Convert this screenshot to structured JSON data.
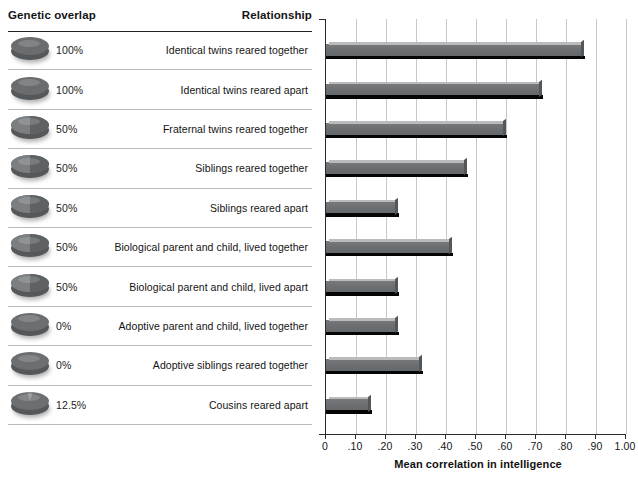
{
  "table": {
    "header_genetic": "Genetic overlap",
    "header_relationship": "Relationship"
  },
  "rows": [
    {
      "percent": "100%",
      "relationship": "Identical twins reared together",
      "disc": "full-100",
      "value": 0.86
    },
    {
      "percent": "100%",
      "relationship": "Identical twins reared apart",
      "disc": "full-100",
      "value": 0.72
    },
    {
      "percent": "50%",
      "relationship": "Fraternal twins reared together",
      "disc": "half-50",
      "value": 0.6
    },
    {
      "percent": "50%",
      "relationship": "Siblings reared together",
      "disc": "half-50",
      "value": 0.47
    },
    {
      "percent": "50%",
      "relationship": "Siblings reared apart",
      "disc": "half-50",
      "value": 0.24
    },
    {
      "percent": "50%",
      "relationship": "Biological parent and child, lived together",
      "disc": "half-50",
      "value": 0.42
    },
    {
      "percent": "50%",
      "relationship": "Biological parent and child, lived apart",
      "disc": "half-50",
      "value": 0.24
    },
    {
      "percent": "0%",
      "relationship": "Adoptive parent and child, lived together",
      "disc": "empty-0",
      "value": 0.24
    },
    {
      "percent": "0%",
      "relationship": "Adoptive siblings reared together",
      "disc": "empty-0",
      "value": 0.32
    },
    {
      "percent": "12.5%",
      "relationship": "Cousins reared apart",
      "disc": "wedge-125",
      "value": 0.15
    }
  ],
  "chart_data": {
    "type": "bar",
    "orientation": "horizontal",
    "title": "",
    "xlabel": "Mean correlation in intelligence",
    "ylabel": "",
    "xlim": [
      0,
      1.0
    ],
    "xticks": [
      0,
      0.1,
      0.2,
      0.3,
      0.4,
      0.5,
      0.6,
      0.7,
      0.8,
      0.9,
      1.0
    ],
    "xtick_labels": [
      "0",
      ".10",
      ".20",
      ".30",
      ".40",
      ".50",
      ".60",
      ".70",
      ".80",
      ".90",
      "1.00"
    ],
    "grid": "vertical",
    "legend": "none",
    "bar_color": "#6d7072",
    "categories": [
      "Identical twins reared together",
      "Identical twins reared apart",
      "Fraternal twins reared together",
      "Siblings reared together",
      "Siblings reared apart",
      "Biological parent and child, lived together",
      "Biological parent and child, lived apart",
      "Adoptive parent and child, lived together",
      "Adoptive siblings reared together",
      "Cousins reared apart"
    ],
    "values": [
      0.86,
      0.72,
      0.6,
      0.47,
      0.24,
      0.42,
      0.24,
      0.24,
      0.32,
      0.15
    ],
    "genetic_overlap": [
      "100%",
      "100%",
      "50%",
      "50%",
      "50%",
      "50%",
      "50%",
      "0%",
      "0%",
      "12.5%"
    ]
  },
  "axis": {
    "title": "Mean correlation in intelligence"
  }
}
